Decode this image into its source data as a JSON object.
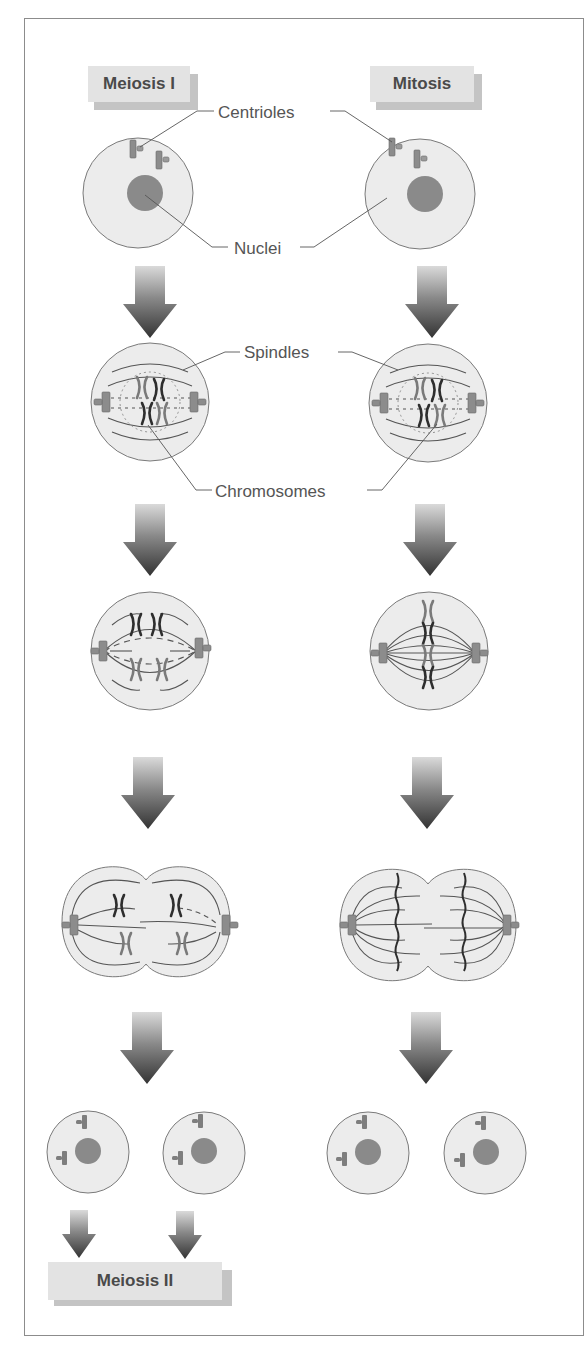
{
  "titles": {
    "left_column": "Meiosis I",
    "right_column": "Mitosis",
    "bottom": "Meiosis II"
  },
  "callouts": {
    "centrioles": "Centrioles",
    "nuclei": "Nuclei",
    "spindles": "Spindles",
    "chromosomes": "Chromosomes"
  },
  "columns": [
    {
      "name": "Meiosis I",
      "stages": [
        "interphase cell",
        "prophase cell",
        "metaphase I (homologous pairs)",
        "anaphase/telophase I (dividing cell)",
        "two daughter cells"
      ],
      "next": "Meiosis II"
    },
    {
      "name": "Mitosis",
      "stages": [
        "interphase cell",
        "prophase cell",
        "metaphase (chromosomes aligned)",
        "anaphase/telophase (dividing cell)",
        "two daughter cells"
      ]
    }
  ],
  "colors": {
    "cell_fill": "#ececec",
    "cell_stroke": "#7a7a7a",
    "nucleus": "#8a8a8a",
    "centriole": "#8c8c8c",
    "arrow_top": "#d4d4d4",
    "arrow_bottom": "#3a3a3a",
    "label_face": "#e3e3e3",
    "label_shadow": "#c4c4c4",
    "text": "#4a4a4a"
  }
}
